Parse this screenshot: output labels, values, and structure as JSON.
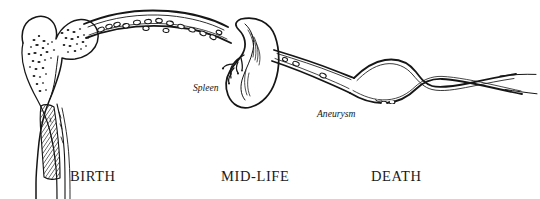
{
  "figure": {
    "background_color": "#ffffff",
    "ink_color": "#161616",
    "width": 540,
    "height": 199
  },
  "stage_labels": [
    {
      "id": "birth",
      "text": "BIRTH"
    },
    {
      "id": "mid-life",
      "text": "MID-LIFE"
    },
    {
      "id": "death",
      "text": "DEATH"
    }
  ],
  "organ_labels": [
    {
      "id": "spleen",
      "text": "Spleen"
    },
    {
      "id": "aneurysm",
      "text": "Aneurysm"
    }
  ],
  "anatomy": {
    "femur": {
      "name": "proximal femur",
      "features": [
        "femoral head",
        "greater trochanter",
        "trabecular bone stipple",
        "hatched marrow cavity",
        "diaphysis shaft"
      ]
    },
    "vessel": {
      "name": "blood vessel",
      "features": [
        "arching segment with circulating cells",
        "descending segment",
        "tapering terminal segment"
      ]
    },
    "spleen": {
      "name": "spleen",
      "features": [
        "bean-shaped capsule",
        "hilum",
        "branching splenic vessels"
      ]
    },
    "aneurysm": {
      "name": "aneurysm",
      "features": [
        "fusiform bulge",
        "pooled thrombus cells"
      ]
    }
  }
}
